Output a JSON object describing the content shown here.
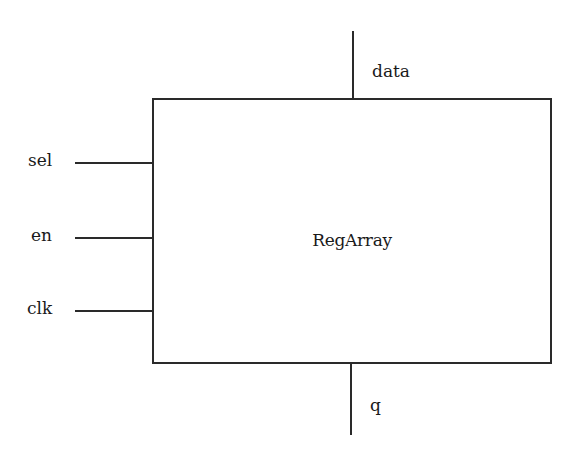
{
  "block": {
    "name": "RegArray"
  },
  "ports": {
    "inputs_left": [
      {
        "name": "sel"
      },
      {
        "name": "en"
      },
      {
        "name": "clk"
      }
    ],
    "input_top": {
      "name": "data"
    },
    "output_bottom": {
      "name": "q"
    }
  },
  "colors": {
    "line": "#2a2a2a",
    "text": "#1a1a1a",
    "background": "#ffffff"
  }
}
